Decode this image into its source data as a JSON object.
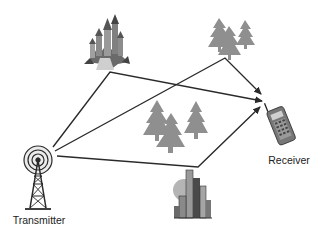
{
  "diagram": {
    "nodes": {
      "transmitter": {
        "label": "Transmitter",
        "icon": "radio-tower-icon"
      },
      "receiver": {
        "label": "Receiver",
        "icon": "mobile-phone-icon"
      },
      "castle": {
        "icon": "castle-icon"
      },
      "trees_top": {
        "icon": "pine-trees-icon"
      },
      "trees_middle": {
        "icon": "pine-trees-icon"
      },
      "buildings": {
        "icon": "city-buildings-icon"
      }
    },
    "paths": [
      {
        "name": "reflection-via-castle",
        "from": "transmitter",
        "via": "castle",
        "to": "receiver"
      },
      {
        "name": "reflection-via-trees",
        "from": "transmitter",
        "via": "trees_top",
        "to": "receiver"
      },
      {
        "name": "reflection-via-buildings",
        "from": "transmitter",
        "via": "buildings",
        "to": "receiver"
      }
    ],
    "colors": {
      "line": "#2a2a2a",
      "tree": "#8c8c8c",
      "building": "#6e6e6e",
      "background": "#ffffff"
    }
  }
}
